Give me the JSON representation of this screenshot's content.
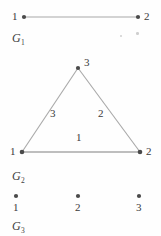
{
  "figure": {
    "width": 161,
    "height": 236,
    "background": "#fefefe",
    "line_color": "#a8a8a8",
    "vertex_color": "#4a4a4a",
    "text_color": "#3a3a3a"
  },
  "graphs": [
    {
      "name": "G",
      "subscript": "1",
      "label_x": 12,
      "label_y": 32,
      "description": "single edge joining vertex 1 and vertex 2",
      "vertices": [
        {
          "id": "1",
          "label": "1",
          "cx": 24,
          "cy": 17,
          "label_x": 12,
          "label_y": 11
        },
        {
          "id": "2",
          "label": "2",
          "cx": 138,
          "cy": 17,
          "label_x": 144,
          "label_y": 11
        }
      ],
      "edges": [
        {
          "from": "1",
          "to": "2",
          "label": "",
          "label_x": 0,
          "label_y": 0
        }
      ]
    },
    {
      "name": "G",
      "subscript": "2",
      "label_x": 12,
      "label_y": 170,
      "description": "triangle on vertices 1, 2, 3 with labelled edges",
      "vertices": [
        {
          "id": "3",
          "label": "3",
          "cx": 78,
          "cy": 68,
          "label_x": 84,
          "label_y": 57
        },
        {
          "id": "1",
          "label": "1",
          "cx": 22,
          "cy": 152,
          "label_x": 10,
          "label_y": 146
        },
        {
          "id": "2",
          "label": "2",
          "cx": 140,
          "cy": 152,
          "label_x": 146,
          "label_y": 146
        }
      ],
      "edges": [
        {
          "from": "1",
          "to": "3",
          "label": "3",
          "label_x": 50,
          "label_y": 108
        },
        {
          "from": "3",
          "to": "2",
          "label": "2",
          "label_x": 98,
          "label_y": 108
        },
        {
          "from": "1",
          "to": "2",
          "label": "1",
          "label_x": 76,
          "label_y": 132
        }
      ]
    },
    {
      "name": "G",
      "subscript": "3",
      "label_x": 12,
      "label_y": 220,
      "description": "three isolated vertices 1, 2 and 3 with no edges",
      "vertices": [
        {
          "id": "1",
          "label": "1",
          "cx": 16,
          "cy": 196,
          "label_x": 13,
          "label_y": 202
        },
        {
          "id": "2",
          "label": "2",
          "cx": 78,
          "cy": 196,
          "label_x": 75,
          "label_y": 202
        },
        {
          "id": "3",
          "label": "3",
          "cx": 139,
          "cy": 196,
          "label_x": 136,
          "label_y": 202
        }
      ],
      "edges": []
    }
  ],
  "specks": [
    {
      "x": 120,
      "y": 35,
      "size": 2
    },
    {
      "x": 136,
      "y": 32,
      "size": 2.5
    }
  ]
}
